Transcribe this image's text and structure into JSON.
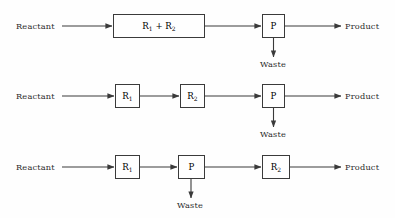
{
  "diagram": {
    "type": "process-flow-diagram",
    "colors": {
      "background": "#fefefe",
      "line": "#3a3a3a",
      "text": "#2b2b2b"
    },
    "labels": {
      "reactant": "Reactant",
      "product": "Product",
      "waste": "Waste"
    },
    "rows": [
      {
        "id": "row-1",
        "input_label": "Reactant",
        "output_label": "Product",
        "waste_label": "Waste",
        "nodes": [
          {
            "id": "r1r2",
            "label_html": "R<sub>1</sub> + R<sub>2</sub>",
            "label_text": "R1 + R2",
            "shape": "wide-rect"
          },
          {
            "id": "p",
            "label_html": "P",
            "label_text": "P",
            "shape": "square",
            "has_waste": true
          }
        ]
      },
      {
        "id": "row-2",
        "input_label": "Reactant",
        "output_label": "Product",
        "waste_label": "Waste",
        "nodes": [
          {
            "id": "r1",
            "label_html": "R<sub>1</sub>",
            "label_text": "R1",
            "shape": "square"
          },
          {
            "id": "r2",
            "label_html": "R<sub>2</sub>",
            "label_text": "R2",
            "shape": "square"
          },
          {
            "id": "p",
            "label_html": "P",
            "label_text": "P",
            "shape": "square",
            "has_waste": true
          }
        ]
      },
      {
        "id": "row-3",
        "input_label": "Reactant",
        "output_label": "Product",
        "waste_label": "Waste",
        "nodes": [
          {
            "id": "r1",
            "label_html": "R<sub>1</sub>",
            "label_text": "R1",
            "shape": "square"
          },
          {
            "id": "p",
            "label_html": "P",
            "label_text": "P",
            "shape": "square",
            "has_waste": true
          },
          {
            "id": "r2",
            "label_html": "R<sub>2</sub>",
            "label_text": "R2",
            "shape": "square"
          }
        ]
      }
    ]
  }
}
